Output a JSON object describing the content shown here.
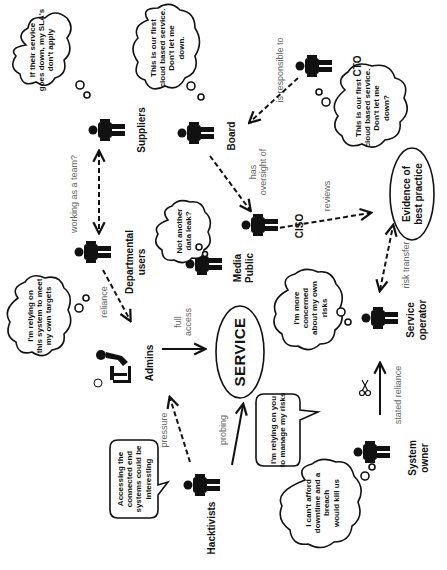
{
  "diagram": {
    "orientation": "rotated-90-clockwise",
    "center": {
      "label": "SERVICE"
    },
    "goal": {
      "label_line1": "Evidence of",
      "label_line2": "best practice"
    },
    "actors": {
      "suppliers": {
        "label": "Suppliers"
      },
      "board": {
        "label": "Board"
      },
      "cto": {
        "label": "CTO"
      },
      "departmental_users": {
        "label_line1": "Departmental",
        "label_line2": "users"
      },
      "media_public": {
        "label_line1": "Media",
        "label_line2": "Public"
      },
      "ciso": {
        "label": "CISO"
      },
      "admins": {
        "label": "Admins"
      },
      "service_operator": {
        "label_line1": "Service",
        "label_line2": "operator"
      },
      "hacktivists": {
        "label": "Hacktivists"
      },
      "system_owner": {
        "label_line1": "System",
        "label_line2": "owner"
      }
    },
    "thoughts": {
      "suppliers": [
        "If their service",
        "goes down, my SLA's",
        "don't apply"
      ],
      "board": [
        "This is our first",
        "cloud based service.",
        "Don't let me",
        "down."
      ],
      "cto": [
        "This is our first",
        "cloud based service.",
        "Don't let me",
        "down?"
      ],
      "departmental_users": [
        "I'm relying on",
        "this system to meet",
        "my own targets"
      ],
      "media_public": [
        "Not another",
        "data leak?"
      ],
      "service_operator": [
        "I'm more",
        "concerned",
        "about my own",
        "risks"
      ],
      "system_owner": [
        "I can't afford",
        "downtime and a",
        "breach",
        "would kill us"
      ]
    },
    "speech": {
      "hacktivists": [
        "Accessing the",
        "connected end",
        "systems could be",
        "interesting"
      ],
      "system_owner": [
        "I'm relying on you",
        "to manage my risks"
      ]
    },
    "edges": {
      "working_as_team": "working as a team?",
      "is_responsible_to": "is responsible to",
      "has_oversight_of_1": "has",
      "has_oversight_of_2": "oversight of",
      "reviews": "reviews",
      "reliance": "reliance",
      "full_access_1": "full",
      "full_access_2": "access",
      "risk_transfer": "risk transfer",
      "pressure": "pressure",
      "probing": "probing",
      "stated_reliance": "stated reliance"
    }
  }
}
